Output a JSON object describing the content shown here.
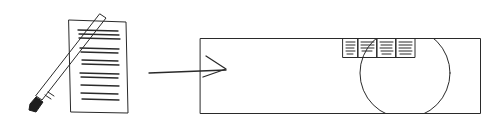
{
  "diagram": {
    "type": "sketch",
    "style": "hand-drawn pencil",
    "colors": {
      "ink": "#2a2a2a",
      "background": "#ffffff",
      "brush_tip": "#1e1e1e"
    },
    "elements": [
      {
        "id": "document",
        "kind": "paper-sheet-with-text-lines",
        "text_lines": 12
      },
      {
        "id": "brush",
        "kind": "paint-brush",
        "orientation": "diagonal"
      },
      {
        "id": "arrow",
        "kind": "arrow",
        "direction": "right",
        "from": "document",
        "to": "canvas"
      },
      {
        "id": "canvas",
        "kind": "rectangle-frame"
      },
      {
        "id": "circle",
        "kind": "circle",
        "clipped_by": "canvas"
      },
      {
        "id": "tiles",
        "kind": "row-of-text-tiles",
        "count": 4
      }
    ]
  }
}
